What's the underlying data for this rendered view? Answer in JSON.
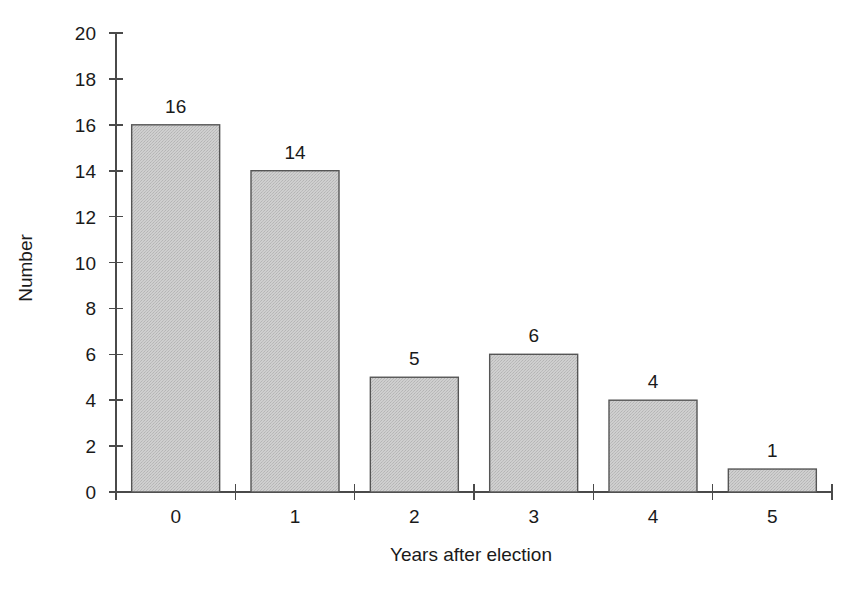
{
  "chart_data": {
    "type": "bar",
    "title": "",
    "subtitle": "",
    "xlabel": "Years after election",
    "ylabel": "Number",
    "categories": [
      "0",
      "1",
      "2",
      "3",
      "4",
      "5"
    ],
    "values": [
      16,
      14,
      5,
      6,
      4,
      1
    ],
    "data_labels": [
      "16",
      "14",
      "5",
      "6",
      "4",
      "1"
    ],
    "ylim": [
      0,
      20
    ],
    "ytick_step": 2,
    "ytick_labels": [
      "0",
      "2",
      "4",
      "6",
      "8",
      "10",
      "12",
      "14",
      "16",
      "18",
      "20"
    ],
    "xtick_labels": [
      "0",
      "1",
      "2",
      "3",
      "4",
      "5"
    ],
    "grid": false,
    "legend": false,
    "legend_position": "none",
    "colors": {
      "bar_fill": "#c9c9c9",
      "bar_edge": "#555555",
      "axis": "#4a4a4a",
      "text": "#1a1a1a",
      "background": "#ffffff"
    }
  }
}
